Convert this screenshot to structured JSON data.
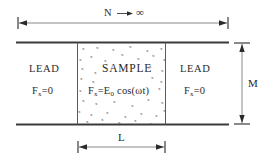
{
  "figure": {
    "title_region": {
      "n_label": "N",
      "arrow_glyph": "——▶",
      "infinity": "∞"
    },
    "left_lead": {
      "title": "LEAD",
      "field_symbol": "F",
      "field_subscript": "x",
      "field_equals": "=0"
    },
    "sample": {
      "title": "SAMPLE",
      "field_symbol": "F",
      "field_subscript": "x",
      "field_equals": "=E",
      "amplitude_subscript": "0",
      "field_tail": " cos(ωt)"
    },
    "right_lead": {
      "title": "LEAD",
      "field_symbol": "F",
      "field_subscript": "x",
      "field_equals": "=0"
    },
    "dimensions": {
      "height_label": "M",
      "sample_length_label": "L"
    },
    "colors": {
      "line": "#3a3a3a",
      "thin_line": "#7a7a7a",
      "text": "#2a2a2a",
      "scatter": "#4a4a4a",
      "background": "#ffffff"
    }
  }
}
